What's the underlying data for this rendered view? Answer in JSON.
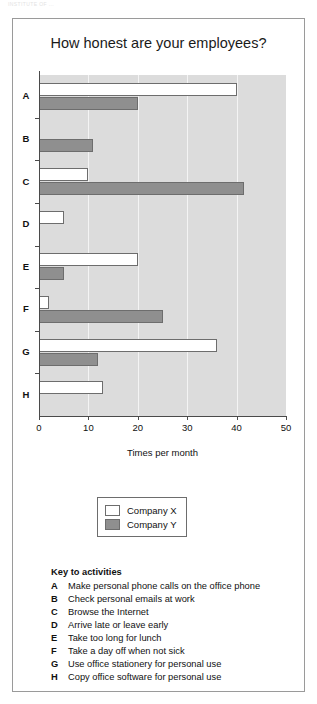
{
  "top_caption": "INSTITUTE OF ...",
  "chart_data": {
    "type": "bar",
    "orientation": "horizontal",
    "title": "How honest are your employees?",
    "xlabel": "Times per month",
    "ylabel": "",
    "xlim": [
      0,
      50
    ],
    "xticks": [
      "0",
      "10",
      "20",
      "30",
      "40",
      "50"
    ],
    "grid": true,
    "legend_position": "below-plot",
    "categories": [
      "A",
      "B",
      "C",
      "D",
      "E",
      "F",
      "G",
      "H"
    ],
    "series": [
      {
        "name": "Company X",
        "color": "#ffffff",
        "values": [
          40,
          0,
          10,
          5,
          20,
          2,
          36,
          13
        ]
      },
      {
        "name": "Company Y",
        "color": "#8f8f8f",
        "values": [
          20,
          11,
          41.5,
          0,
          5,
          25,
          12,
          0
        ]
      }
    ]
  },
  "legend": {
    "items": [
      {
        "label": "Company X",
        "swatch": "x"
      },
      {
        "label": "Company Y",
        "swatch": "y"
      }
    ]
  },
  "key": {
    "title": "Key to activities",
    "items": [
      {
        "letter": "A",
        "text": "Make personal phone calls on the office phone"
      },
      {
        "letter": "B",
        "text": "Check personal emails at work"
      },
      {
        "letter": "C",
        "text": "Browse the Internet"
      },
      {
        "letter": "D",
        "text": "Arrive late or leave early"
      },
      {
        "letter": "E",
        "text": "Take too long for lunch"
      },
      {
        "letter": "F",
        "text": "Take a day off when not sick"
      },
      {
        "letter": "G",
        "text": "Use office stationery for personal use"
      },
      {
        "letter": "H",
        "text": "Copy office software for personal use"
      }
    ]
  }
}
